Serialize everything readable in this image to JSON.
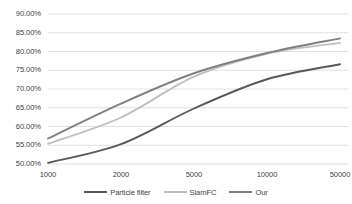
{
  "chart_data": {
    "type": "line",
    "title": "",
    "xlabel": "",
    "ylabel": "",
    "x_scale": "categorical",
    "categories": [
      "1000",
      "2000",
      "5000",
      "10000",
      "50000"
    ],
    "x_tick_labels": [
      "1000",
      "2000",
      "5000",
      "10000",
      "50000"
    ],
    "y_tick_labels": [
      "50.00%",
      "55.00%",
      "60.00%",
      "65.00%",
      "70.00%",
      "75.00%",
      "80.00%",
      "85.00%",
      "90.00%"
    ],
    "ylim": [
      48.0,
      91.5
    ],
    "y_tick_values": [
      50,
      55,
      60,
      65,
      70,
      75,
      80,
      85,
      90
    ],
    "grid": true,
    "grid_axis": "y",
    "legend_position": "bottom",
    "series": [
      {
        "name": "Particle filter",
        "color": "#595959",
        "values": [
          50.3,
          55.3,
          64.8,
          72.6,
          76.6
        ]
      },
      {
        "name": "SiamFC",
        "color": "#bfbfbf",
        "values": [
          55.4,
          62.4,
          73.3,
          79.4,
          82.3
        ]
      },
      {
        "name": "Our",
        "color": "#808080",
        "values": [
          56.8,
          66.1,
          74.2,
          79.6,
          83.5
        ]
      }
    ]
  },
  "legend": {
    "items": [
      {
        "label": "Particle filter",
        "color": "#595959"
      },
      {
        "label": "SiamFC",
        "color": "#bfbfbf"
      },
      {
        "label": "Our",
        "color": "#808080"
      }
    ]
  },
  "axes": {
    "grid_color": "#d9d9d9",
    "tick_text_color": "#3f3f3f"
  }
}
